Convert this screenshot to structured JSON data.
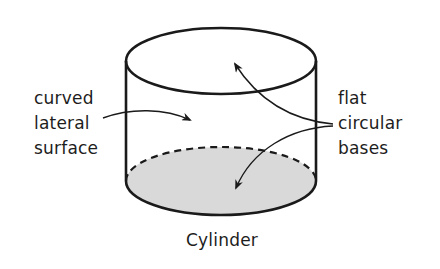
{
  "diagram": {
    "caption": "Cylinder",
    "labels": {
      "lateral": [
        "curved",
        "lateral",
        "surface"
      ],
      "bases": [
        "flat",
        "circular",
        "bases"
      ]
    },
    "colors": {
      "stroke": "#1a1a1a",
      "base_fill": "#d9d9d9",
      "background": "#ffffff"
    }
  }
}
